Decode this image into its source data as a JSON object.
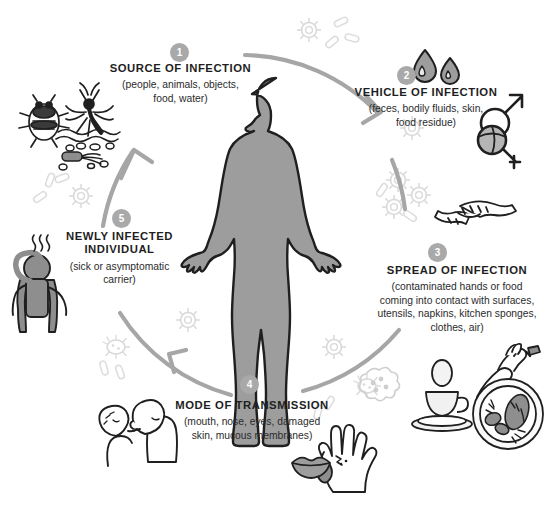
{
  "diagram": {
    "type": "infection-transmission-cycle",
    "accent_gray": "#9a9a9a",
    "body_fill": "#9d9d9d",
    "germ_gray": "#d8d8d8",
    "steps": [
      {
        "number": "1",
        "title": "SOURCE OF INFECTION",
        "subtitle": "(people, animals, objects,\nfood, water)",
        "icons": [
          "bedbug-icon",
          "mosquito-icon",
          "water-waves-icon",
          "bacteria-icon"
        ]
      },
      {
        "number": "2",
        "title": "VEHICLE OF INFECTION",
        "subtitle": "(feces, bodily fluids, skin,\nfood residue)",
        "icons": [
          "water-droplets-icon",
          "gender-symbols-icon"
        ]
      },
      {
        "number": "3",
        "title": "SPREAD OF INFECTION",
        "subtitle": "(contaminated hands or food\ncoming into contact with surfaces,\nutensils, napkins, kitchen sponges,\nclothes, air)",
        "icons": [
          "handshake-icon",
          "faucet-hand-icon",
          "teacup-icon",
          "egg-icon",
          "food-plate-icon"
        ]
      },
      {
        "number": "4",
        "title": "MODE OF TRANSMISSION",
        "subtitle": "(mouth, nose, eyes, damaged\nskin, mucous membranes)",
        "icons": [
          "kissing-couple-icon",
          "wounded-hand-icon",
          "lips-icon",
          "amoeba-icon"
        ]
      },
      {
        "number": "5",
        "title": "NEWLY INFECTED\nINDIVIDUAL",
        "subtitle": "(sick or asymptomatic\ncarrier)",
        "icons": [
          "sick-person-icon",
          "fever-waves-icon"
        ]
      }
    ],
    "center": {
      "name": "human-body-silhouette"
    },
    "arrows": [
      {
        "name": "arc-step1-to-step2",
        "direction": "clockwise"
      },
      {
        "name": "arc-step2-to-step3",
        "direction": "clockwise"
      },
      {
        "name": "arc-step3-to-step4",
        "direction": "clockwise"
      },
      {
        "name": "arc-step4-to-step5",
        "direction": "clockwise"
      },
      {
        "name": "arc-step5-to-step1",
        "direction": "clockwise"
      }
    ]
  }
}
